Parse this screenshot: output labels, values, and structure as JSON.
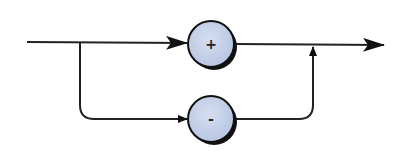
{
  "diagram": {
    "type": "flow",
    "nodes": [
      {
        "id": "plus",
        "label": "+",
        "cx": 211,
        "cy": 44,
        "r": 23
      },
      {
        "id": "minus",
        "label": "-",
        "cx": 211,
        "cy": 119,
        "r": 23
      }
    ],
    "edges": [
      {
        "from": "input",
        "to": "plus"
      },
      {
        "from": "input",
        "to": "minus"
      },
      {
        "from": "plus",
        "to": "output"
      },
      {
        "from": "minus",
        "to": "output"
      }
    ],
    "colors": {
      "node_fill": "#c8d4ea",
      "node_stroke": "#111111",
      "line": "#222222"
    }
  }
}
